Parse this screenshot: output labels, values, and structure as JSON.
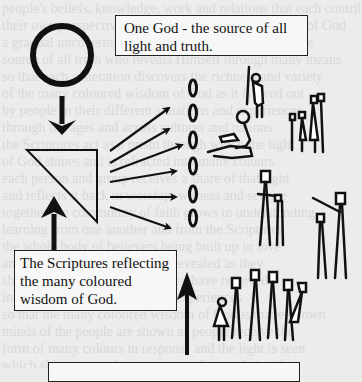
{
  "background": {
    "description": "faint bleed-through text from reverse page",
    "lines": [
      "people's beliefs, knowledge, work and relations that each contribute",
      "their own perspective to the whole picture of the truth of God",
      "a gradual uncovering of the light which comes from the",
      "source of all truth who reveals Himself through many means",
      "so that each generation discovers the richness and variety",
      "of the many coloured wisdom of God as it is lived out",
      "by people in their different situations and experiences",
      "through the ages and across cultures and nations",
      "the Scriptures act as a prism through which the light",
      "of God shines and is refracted into many colours",
      "each person and group receives a share of that light",
      "and reflects it back in worship, witness and service",
      "together the community of faith grows in understanding",
      "learning from one another and from the Scriptures",
      "the whole body of believers being built up in love",
      "and the truth being more fully revealed as they",
      "share with one another what they have received",
      "in the variety of their gifts and experiences",
      "so that the many coloured wisdom of God is made known",
      "minds of the people are shown as people receive the",
      "form of many colours in response and the light is seen",
      "which shines upon the many according to their gifts"
    ]
  },
  "labels": {
    "god": "One God - the source of all light and truth.",
    "scriptures": "The Scriptures reflecting the many coloured wisdom of God.",
    "bottom": ""
  },
  "diagram": {
    "source_symbol": "circle",
    "prism_symbol": "right-triangle",
    "rays_count": 6,
    "ovals_count": 6,
    "people_groups": [
      "elderly-person-with-staff",
      "person-reading-book",
      "family-of-four",
      "adult-with-child",
      "adult-pointing-with-child",
      "crowd-of-people"
    ]
  },
  "colors": {
    "ink": "#111111",
    "paper": "#ececec",
    "box_fill": "#f7f7f7"
  }
}
